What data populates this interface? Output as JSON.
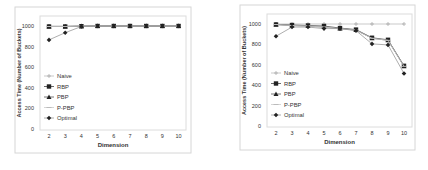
{
  "chart_data": [
    {
      "type": "line",
      "title": "",
      "xlabel": "Dimension",
      "ylabel": "Access Time (Number of Buckets)",
      "x": [
        2,
        3,
        4,
        5,
        6,
        7,
        8,
        9,
        10
      ],
      "ylim": [
        0,
        1000
      ],
      "yticks": [
        0,
        200,
        400,
        600,
        800,
        1000
      ],
      "grid": false,
      "legend_position": "lower left inside",
      "series": [
        {
          "name": "Naive",
          "marker": "plus",
          "values": [
            1000,
            1000,
            1000,
            1000,
            1000,
            1000,
            1000,
            1000,
            1000
          ]
        },
        {
          "name": "RBP",
          "marker": "square",
          "values": [
            995,
            995,
            998,
            1000,
            1000,
            1000,
            1000,
            1000,
            1000
          ]
        },
        {
          "name": "PBP",
          "marker": "triangle",
          "values": [
            995,
            995,
            998,
            1000,
            1000,
            1000,
            1000,
            1000,
            1000
          ]
        },
        {
          "name": "P-PBP",
          "marker": "dash",
          "values": [
            995,
            995,
            998,
            1000,
            1000,
            1000,
            1000,
            1000,
            1000
          ]
        },
        {
          "name": "Optimal",
          "marker": "diamond",
          "values": [
            865,
            935,
            995,
            1000,
            1000,
            1000,
            1000,
            1000,
            1000
          ]
        }
      ]
    },
    {
      "type": "line",
      "title": "",
      "xlabel": "Dimension",
      "ylabel": "Access Time (Number of Buckets)",
      "x": [
        2,
        3,
        4,
        5,
        6,
        7,
        8,
        9,
        10
      ],
      "ylim": [
        0,
        1000
      ],
      "yticks": [
        0,
        200,
        400,
        600,
        800,
        1000
      ],
      "grid": false,
      "legend_position": "lower left inside",
      "series": [
        {
          "name": "Naive",
          "marker": "plus",
          "values": [
            1000,
            1000,
            1000,
            1000,
            1000,
            1000,
            1000,
            1000,
            1000
          ]
        },
        {
          "name": "RBP",
          "marker": "square",
          "values": [
            995,
            990,
            985,
            980,
            960,
            945,
            865,
            845,
            590
          ]
        },
        {
          "name": "PBP",
          "marker": "triangle",
          "values": [
            995,
            985,
            980,
            970,
            955,
            940,
            860,
            840,
            585
          ]
        },
        {
          "name": "P-PBP",
          "marker": "dash",
          "values": [
            995,
            985,
            980,
            970,
            955,
            940,
            860,
            840,
            585
          ]
        },
        {
          "name": "Optimal",
          "marker": "diamond",
          "values": [
            880,
            970,
            970,
            955,
            955,
            935,
            805,
            795,
            515
          ]
        }
      ]
    }
  ]
}
